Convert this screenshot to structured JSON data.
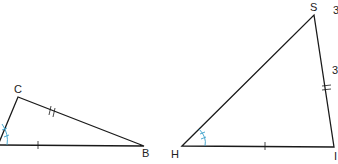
{
  "diagram": {
    "triangle_left": {
      "labels": {
        "top": "C",
        "right": "B"
      },
      "vertices": {
        "left": [
          -2,
          145
        ],
        "top": [
          18,
          97
        ],
        "right": [
          144,
          146
        ]
      },
      "marks": {
        "base": "single-tick",
        "C_B": "double-tick",
        "left_angle": "double-arc"
      }
    },
    "triangle_right": {
      "labels": {
        "left": "H",
        "top": "S",
        "right": "I"
      },
      "vertices": {
        "left": [
          182,
          146
        ],
        "top": [
          314,
          15
        ],
        "right": [
          334,
          147
        ]
      },
      "marks": {
        "base": "single-tick",
        "S_I": "double-tick",
        "H_angle": "double-arc"
      }
    },
    "edge_fragments": [
      "3",
      "3"
    ],
    "colors": {
      "line": "#1a1a1a",
      "angle_mark": "#3a9fc9",
      "text": "#222222"
    }
  }
}
